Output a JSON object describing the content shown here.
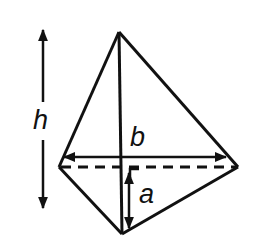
{
  "diagram": {
    "type": "tetrahedron-dimensions",
    "labels": {
      "height": "h",
      "base": "b",
      "offset": "a"
    },
    "colors": {
      "stroke": "#111111",
      "background": "#ffffff"
    }
  }
}
